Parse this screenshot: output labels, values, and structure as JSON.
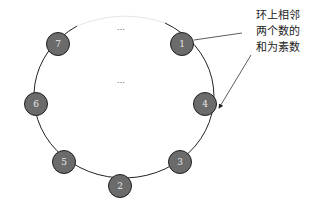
{
  "diagram": {
    "ellipsis_top": "…",
    "ellipsis_center": "…",
    "nodes": [
      {
        "label": "1",
        "cx": 182,
        "cy": 44
      },
      {
        "label": "4",
        "cx": 205,
        "cy": 104
      },
      {
        "label": "3",
        "cx": 180,
        "cy": 162
      },
      {
        "label": "2",
        "cx": 120,
        "cy": 186
      },
      {
        "label": "5",
        "cx": 64,
        "cy": 162
      },
      {
        "label": "6",
        "cx": 36,
        "cy": 104
      },
      {
        "label": "7",
        "cx": 58,
        "cy": 44
      }
    ],
    "annotation": {
      "lines": [
        "环上相邻",
        "两个数的",
        "和为素数"
      ]
    },
    "colors": {
      "node_fill": "#6b6b6b",
      "node_stroke": "#222222",
      "ring": "#222222",
      "node_text": "#e8e8e8"
    }
  }
}
